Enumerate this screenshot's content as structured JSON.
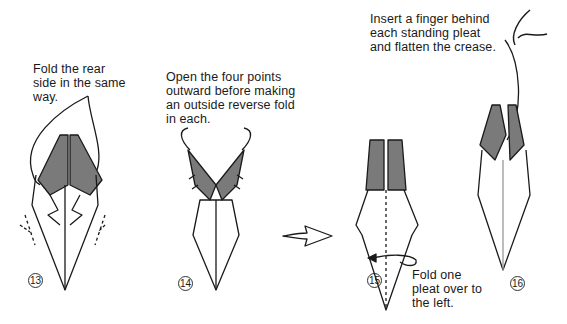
{
  "steps": [
    {
      "number": "13",
      "caption": "Fold the rear\nside in the same\nway."
    },
    {
      "number": "14",
      "caption": "Open the four points\noutward before making\nan outside reverse fold\nin each."
    },
    {
      "number": "15",
      "caption": "Fold one\npleat over to\nthe left."
    },
    {
      "number": "16",
      "caption": "Insert a finger behind\neach standing pleat\nand flatten the crease."
    }
  ],
  "colors": {
    "shade": "#7a7a7a",
    "line": "#1a1a1a",
    "paper": "#ffffff"
  }
}
